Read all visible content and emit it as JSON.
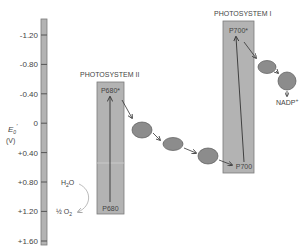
{
  "axis": {
    "label_main": "E",
    "label_sub": "0",
    "label_prime": "′",
    "label_unit": "(V)",
    "ticks": [
      "-1.20",
      "-0.80",
      "-0.40",
      "0",
      "+0.40",
      "+0.80",
      "+1.20",
      "+1.60"
    ]
  },
  "photosystem2": {
    "title": "PHOTOSYSTEM II",
    "top_label": "P680*",
    "bottom_label": "P680"
  },
  "photosystem1": {
    "title": "PHOTOSYSTEM I",
    "top_label": "P700*",
    "bottom_label": "P700"
  },
  "water": {
    "donor": "H",
    "donor_sub": "2",
    "donor_tail": "O",
    "product_prefix": "½ O",
    "product_sub": "2"
  },
  "nadp": {
    "label": "NADP",
    "sup": "+"
  },
  "colors": {
    "box_fill": "#b3b3b3",
    "box_stroke": "#7a7a7a",
    "carrier_fill": "#8c8c8c",
    "carrier_stroke": "#5a5a5a",
    "text": "#444444",
    "arrow": "#333333"
  }
}
